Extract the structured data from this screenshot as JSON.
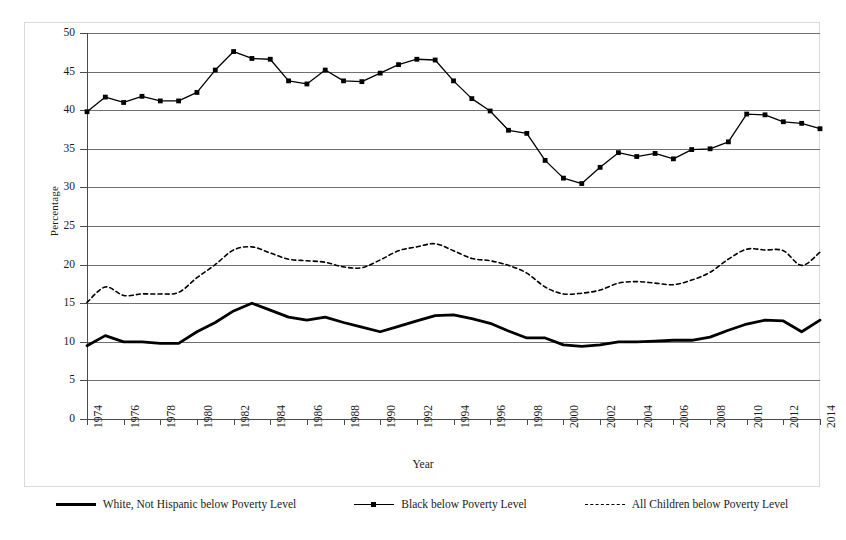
{
  "axes": {
    "ylabel": "Percentage",
    "xlabel": "Year",
    "yticks": [
      "0",
      "5",
      "10",
      "15",
      "20",
      "25",
      "30",
      "35",
      "40",
      "45",
      "50"
    ],
    "xticks": [
      "1974",
      "1976",
      "1978",
      "1980",
      "1982",
      "1984",
      "1986",
      "1988",
      "1990",
      "1992",
      "1994",
      "1996",
      "1998",
      "2000",
      "2002",
      "2004",
      "2006",
      "2008",
      "2010",
      "2012",
      "2014"
    ]
  },
  "legend": {
    "items": [
      {
        "label": "White, Not Hispanic below Poverty Level",
        "style": "solid-thick"
      },
      {
        "label": "Black below Poverty Level",
        "style": "solid-marker"
      },
      {
        "label": "All Children below Poverty Level",
        "style": "dashed"
      }
    ]
  },
  "chart_data": {
    "type": "line",
    "title": "",
    "xlabel": "Year",
    "ylabel": "Percentage",
    "xlim": [
      1974,
      2014
    ],
    "ylim": [
      0,
      50
    ],
    "ytick_step": 5,
    "xtick_step": 2,
    "grid": "horizontal",
    "legend_position": "bottom",
    "x": [
      1974,
      1975,
      1976,
      1977,
      1978,
      1979,
      1980,
      1981,
      1982,
      1983,
      1984,
      1985,
      1986,
      1987,
      1988,
      1989,
      1990,
      1991,
      1992,
      1993,
      1994,
      1995,
      1996,
      1997,
      1998,
      1999,
      2000,
      2001,
      2002,
      2003,
      2004,
      2005,
      2006,
      2007,
      2008,
      2009,
      2010,
      2011,
      2012,
      2013,
      2014
    ],
    "series": [
      {
        "name": "White, Not Hispanic below Poverty Level",
        "style": "solid-thick",
        "color": "#000000",
        "values": [
          9.5,
          10.8,
          10.0,
          10.0,
          9.8,
          9.8,
          11.3,
          12.5,
          14.0,
          15.0,
          14.1,
          13.2,
          12.8,
          13.2,
          12.5,
          11.9,
          11.3,
          12.0,
          12.7,
          13.4,
          13.5,
          13.0,
          12.4,
          11.4,
          10.5,
          10.5,
          9.6,
          9.4,
          9.6,
          10.0,
          10.0,
          10.1,
          10.2,
          10.2,
          10.6,
          11.5,
          12.3,
          12.8,
          12.7,
          11.3,
          12.8
        ]
      },
      {
        "name": "Black below Poverty Level",
        "style": "solid-marker",
        "color": "#000000",
        "values": [
          39.8,
          41.7,
          41.0,
          41.8,
          41.2,
          41.2,
          42.3,
          45.2,
          47.6,
          46.7,
          46.6,
          43.8,
          43.4,
          45.2,
          43.8,
          43.7,
          44.8,
          45.9,
          46.6,
          46.5,
          43.8,
          41.5,
          39.9,
          37.4,
          37.0,
          33.5,
          31.2,
          30.5,
          32.6,
          34.5,
          34.0,
          34.4,
          33.7,
          34.9,
          35.0,
          35.9,
          39.5,
          39.4,
          38.5,
          38.3,
          37.6
        ]
      },
      {
        "name": "All Children below Poverty Level",
        "style": "dashed",
        "color": "#000000",
        "values": [
          15.1,
          17.1,
          16.0,
          16.2,
          16.2,
          16.4,
          18.3,
          20.0,
          21.9,
          22.3,
          21.5,
          20.7,
          20.5,
          20.3,
          19.7,
          19.6,
          20.6,
          21.8,
          22.3,
          22.7,
          21.8,
          20.8,
          20.5,
          19.9,
          18.9,
          17.1,
          16.2,
          16.3,
          16.7,
          17.6,
          17.8,
          17.6,
          17.4,
          18.0,
          19.0,
          20.7,
          22.0,
          21.9,
          21.8,
          19.9,
          21.6
        ]
      }
    ]
  }
}
